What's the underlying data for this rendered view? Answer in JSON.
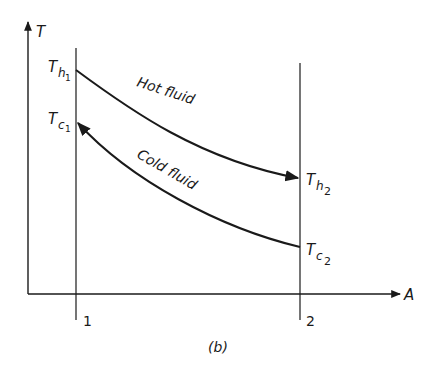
{
  "diagram": {
    "axes": {
      "y_label": "T",
      "x_label": "A"
    },
    "stations": [
      {
        "label": "1"
      },
      {
        "label": "2"
      }
    ],
    "temperatures": {
      "th1": {
        "base": "T",
        "sub": "h",
        "subsub": "1"
      },
      "tc1": {
        "base": "T",
        "sub": "c",
        "subsub": "1"
      },
      "th2": {
        "base": "T",
        "sub": "h",
        "subsub": "2"
      },
      "tc2": {
        "base": "T",
        "sub": "c",
        "subsub": "2"
      }
    },
    "curves": {
      "hot": {
        "label": "Hot fluid",
        "direction": "1 to 2"
      },
      "cold": {
        "label": "Cold fluid",
        "direction": "2 to 1"
      }
    },
    "caption": "(b)",
    "colors": {
      "line": "#1a1a1a",
      "background": "#ffffff"
    }
  }
}
